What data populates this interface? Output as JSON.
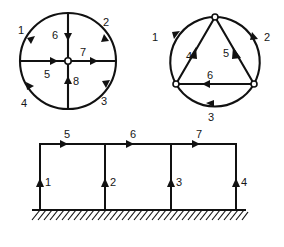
{
  "page": {
    "background_color": "#ffffff",
    "line_color": "#111111",
    "label_color": "#161616",
    "width": 284,
    "height": 247
  },
  "figures": [
    {
      "id": "circle-spokes",
      "name": "circle-with-cross-spokes",
      "description": "Circle divided into four arcs with a central node and four radial spokes",
      "center": [
        68,
        61
      ],
      "radius": 48,
      "center_node": {
        "type": "open-circle",
        "x": 68,
        "y": 61,
        "r": 3.2
      },
      "arcs": [
        {
          "label": "1",
          "label_x": 22,
          "label_y": 31,
          "from_deg": 180,
          "to_deg": 270,
          "arrow_at_deg": 208,
          "arrow_dir": "counterclockwise"
        },
        {
          "label": "2",
          "label_x": 106,
          "label_y": 25,
          "from_deg": 270,
          "to_deg": 360,
          "arrow_at_deg": 332,
          "arrow_dir": "clockwise"
        },
        {
          "label": "3",
          "label_x": 104,
          "label_y": 102,
          "from_deg": 0,
          "to_deg": 90,
          "arrow_at_deg": 28,
          "arrow_dir": "clockwise"
        },
        {
          "label": "4",
          "label_x": 24,
          "label_y": 104,
          "from_deg": 90,
          "to_deg": 180,
          "arrow_at_deg": 152,
          "arrow_dir": "counterclockwise"
        }
      ],
      "spokes": [
        {
          "label": "5",
          "label_x": 47,
          "label_y": 75,
          "from": [
            20,
            61
          ],
          "to": [
            68,
            61
          ],
          "arrow_at": [
            56,
            61
          ],
          "arrow_dir": "right"
        },
        {
          "label": "6",
          "label_x": 56,
          "label_y": 39,
          "from": [
            68,
            13
          ],
          "to": [
            68,
            61
          ],
          "arrow_at": [
            68,
            40
          ],
          "arrow_dir": "down"
        },
        {
          "label": "7",
          "label_x": 82,
          "label_y": 54,
          "from": [
            68,
            61
          ],
          "to": [
            116,
            61
          ],
          "arrow_at": [
            96,
            61
          ],
          "arrow_dir": "right"
        },
        {
          "label": "8",
          "label_x": 76,
          "label_y": 81,
          "from": [
            68,
            109
          ],
          "to": [
            68,
            61
          ],
          "arrow_at": [
            68,
            80
          ],
          "arrow_dir": "up"
        }
      ]
    },
    {
      "id": "circle-triangle",
      "name": "circle-with-inscribed-triangle",
      "description": "Circle with three boundary nodes joined by an inscribed triangle; arcs and chords numbered",
      "center": [
        75,
        62
      ],
      "radius": 45,
      "nodes": [
        {
          "name": "node-top",
          "x": 75,
          "y": 17,
          "type": "open-circle",
          "r": 3.0
        },
        {
          "name": "node-bottom-left",
          "x": 36,
          "y": 84,
          "type": "open-circle",
          "r": 3.0
        },
        {
          "name": "node-bottom-right",
          "x": 114,
          "y": 84,
          "type": "open-circle",
          "r": 3.0
        }
      ],
      "arcs": [
        {
          "label": "1",
          "label_x": 16,
          "label_y": 37,
          "from_deg": 240,
          "to_deg": 150,
          "arrow_at_deg": 215,
          "arrow_dir": "counterclockwise"
        },
        {
          "label": "2",
          "label_x": 126,
          "label_y": 37,
          "from_deg": 300,
          "to_deg": 30,
          "arrow_at_deg": 325,
          "arrow_dir": "clockwise"
        },
        {
          "label": "3",
          "label_x": 71,
          "label_y": 118,
          "from_deg": 30,
          "to_deg": 150,
          "arrow_at_deg": 95,
          "arrow_dir": "counterclockwise"
        }
      ],
      "chords": [
        {
          "label": "4",
          "label_x": 50,
          "label_y": 56,
          "from": [
            36,
            84
          ],
          "to": [
            75,
            17
          ],
          "arrow_at": [
            52,
            56
          ],
          "arrow_dir": "up-right"
        },
        {
          "label": "5",
          "label_x": 87,
          "label_y": 53,
          "from": [
            114,
            84
          ],
          "to": [
            75,
            17
          ],
          "arrow_at": [
            97,
            53
          ],
          "arrow_dir": "up-left"
        },
        {
          "label": "6",
          "label_x": 70,
          "label_y": 76,
          "from": [
            114,
            84
          ],
          "to": [
            36,
            84
          ],
          "arrow_at": [
            73,
            84
          ],
          "arrow_dir": "left"
        }
      ]
    },
    {
      "id": "frame",
      "name": "three-bay-portal-frame",
      "description": "Three-bay rigid frame on fixed hatched ground support, with numbered column and beam members",
      "geometry": {
        "left_x": 26,
        "right_x": 222,
        "top_y": 20,
        "base_y": 86,
        "column_xs": [
          26,
          91,
          157,
          222
        ],
        "ground_y": 86,
        "hatch_from_x": 18,
        "hatch_to_x": 232
      },
      "columns": [
        {
          "label": "1",
          "label_x": 33,
          "label_y": 58,
          "x": 26,
          "arrow_at_y": 56,
          "arrow_dir": "up"
        },
        {
          "label": "2",
          "label_x": 98,
          "label_y": 58,
          "x": 91,
          "arrow_at_y": 56,
          "arrow_dir": "up"
        },
        {
          "label": "3",
          "label_x": 164,
          "label_y": 58,
          "x": 157,
          "arrow_at_y": 56,
          "arrow_dir": "up"
        },
        {
          "label": "4",
          "label_x": 229,
          "label_y": 58,
          "x": 222,
          "arrow_at_y": 56,
          "arrow_dir": "up"
        }
      ],
      "beams": [
        {
          "label": "5",
          "label_x": 54,
          "label_y": 12,
          "from": [
            26,
            20
          ],
          "to": [
            91,
            20
          ],
          "arrow_at": [
            53,
            20
          ],
          "arrow_dir": "right"
        },
        {
          "label": "6",
          "label_x": 120,
          "label_y": 12,
          "from": [
            91,
            20
          ],
          "to": [
            157,
            20
          ],
          "arrow_at": [
            119,
            20
          ],
          "arrow_dir": "right"
        },
        {
          "label": "7",
          "label_x": 186,
          "label_y": 12,
          "from": [
            157,
            20
          ],
          "to": [
            222,
            20
          ],
          "arrow_at": [
            185,
            20
          ],
          "arrow_dir": "right"
        }
      ]
    }
  ],
  "labels": {
    "all": [
      "1",
      "2",
      "3",
      "4",
      "5",
      "6",
      "7",
      "8"
    ]
  }
}
